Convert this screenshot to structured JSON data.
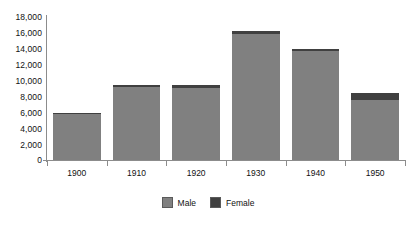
{
  "chart_data": {
    "type": "bar",
    "stacked": true,
    "title": "",
    "xlabel": "",
    "ylabel": "",
    "categories": [
      "1900",
      "1910",
      "1920",
      "1930",
      "1940",
      "1950"
    ],
    "series": [
      {
        "name": "Male",
        "color": "#808080",
        "values": [
          5750,
          9200,
          9100,
          15800,
          13700,
          7600
        ]
      },
      {
        "name": "Female",
        "color": "#404040",
        "values": [
          150,
          300,
          300,
          400,
          300,
          800
        ]
      }
    ],
    "totals": [
      5900,
      9500,
      9400,
      16200,
      14000,
      8400
    ],
    "ylim": [
      0,
      18000
    ],
    "ytick_step": 2000,
    "ytick_labels": [
      "18,000",
      "16,000",
      "14,000",
      "12,000",
      "10,000",
      "8,000",
      "6,000",
      "4,000",
      "2,000",
      "0"
    ],
    "ytick_values": [
      18000,
      16000,
      14000,
      12000,
      10000,
      8000,
      6000,
      4000,
      2000,
      0
    ],
    "grid": false,
    "legend_position": "bottom",
    "legend": [
      "Male",
      "Female"
    ]
  }
}
